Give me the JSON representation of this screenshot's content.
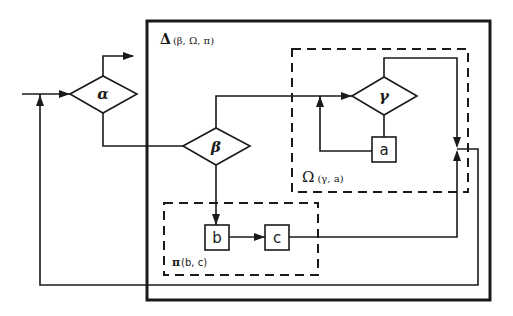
{
  "diagram": {
    "type": "flowchart",
    "groups": [
      {
        "id": "delta",
        "symbol": "Δ",
        "args": "(β, Ω, π)",
        "style": "solid-thick"
      },
      {
        "id": "omega",
        "symbol": "Ω",
        "args": "(γ, a)",
        "style": "dashed"
      },
      {
        "id": "pi",
        "symbol": "π",
        "args": "(b, c)",
        "style": "dashed"
      }
    ],
    "decisions": [
      {
        "id": "alpha",
        "label": "α"
      },
      {
        "id": "beta",
        "label": "β"
      },
      {
        "id": "gamma",
        "label": "γ"
      }
    ],
    "processes": [
      {
        "id": "a",
        "label": "a"
      },
      {
        "id": "b",
        "label": "b"
      },
      {
        "id": "c",
        "label": "c"
      }
    ],
    "edges": [
      {
        "from": "input",
        "to": "alpha"
      },
      {
        "from": "alpha",
        "to": "exit"
      },
      {
        "from": "alpha",
        "to": "beta"
      },
      {
        "from": "beta",
        "to": "gamma"
      },
      {
        "from": "beta",
        "to": "b"
      },
      {
        "from": "b",
        "to": "c"
      },
      {
        "from": "gamma",
        "to": "merge"
      },
      {
        "from": "gamma",
        "to": "a"
      },
      {
        "from": "a",
        "to": "gamma"
      },
      {
        "from": "c",
        "to": "merge"
      },
      {
        "from": "merge",
        "to": "alpha"
      }
    ]
  }
}
